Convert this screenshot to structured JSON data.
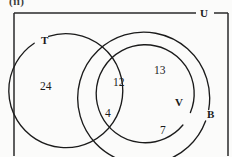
{
  "figure": {
    "caption": "(ii)",
    "universe_label": "U",
    "sets": [
      {
        "key": "T",
        "label": "T",
        "name": "set-t"
      },
      {
        "key": "B",
        "label": "B",
        "name": "set-b"
      },
      {
        "key": "V",
        "label": "V",
        "name": "set-v"
      }
    ],
    "regions": [
      {
        "key": "t_only",
        "label": "24",
        "description": "T only"
      },
      {
        "key": "t_and_v",
        "label": "12",
        "description": "T and V"
      },
      {
        "key": "v_only",
        "label": "13",
        "description": "V only"
      },
      {
        "key": "t_and_b",
        "label": "4",
        "description": "T and B not V"
      },
      {
        "key": "b_only",
        "label": "7",
        "description": "B only"
      }
    ],
    "colors": {
      "stroke": "#1b1b1b",
      "frame": "#2a2a2a",
      "background": "#fbfbfa",
      "text": "#1a1a1a"
    }
  }
}
